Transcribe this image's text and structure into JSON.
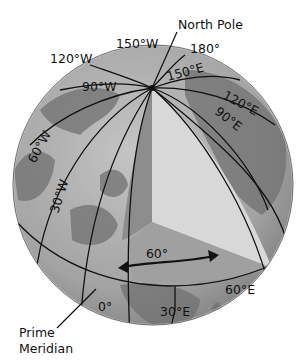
{
  "figure": {
    "callouts": {
      "north_pole": "North Pole",
      "prime_meridian_line1": "Prime",
      "prime_meridian_line2": "Meridian"
    },
    "angle_label": "60°",
    "meridian_labels": {
      "w150": "150°W",
      "w120": "120°W",
      "w90": "90°W",
      "w60": "60°W",
      "w30": "30°W",
      "e180": "180°",
      "e150": "150°E",
      "e120": "120°E",
      "e90": "90°E",
      "e60": "60°E",
      "e30": "30°E",
      "zero": "0°"
    },
    "colors": {
      "ocean": "#a9a9a9",
      "land": "#6f6f6f",
      "wedge_left": "#8c8c8c",
      "wedge_right": "#d6d6d6",
      "wedge_bottom": "#9e9e9e",
      "lines": "#111111"
    }
  }
}
